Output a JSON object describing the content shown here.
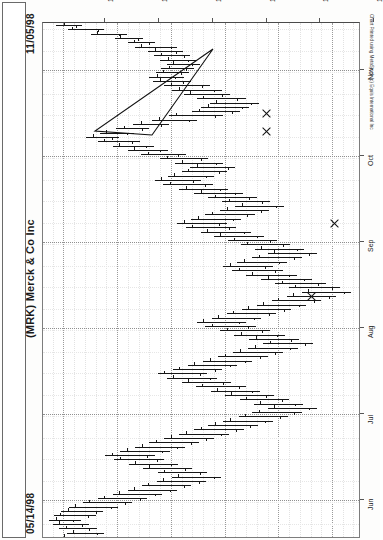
{
  "header": {
    "date_end": "11/05/98",
    "date_start": "05/14/98",
    "title": "(MRK) Merck & Co Inc",
    "detail": "Merck & Co Inc-Daily  12/15/98  C=145.875 +.312  O=145.500  H=146.000  L=141.500  V=3724300"
  },
  "credit": "Chart Printed using MetaStock (c) Equis International Inc",
  "chart_data": {
    "type": "ohlc-bar",
    "title": "(MRK) Merck & Co Inc",
    "orientation": "rotated-90",
    "xlabel": "Date",
    "ylabel": "Price",
    "grid": true,
    "legend": "none",
    "price_axis": {
      "ticks": [
        140,
        135,
        130,
        125,
        120,
        115
      ],
      "labels": [
        "140",
        "135",
        "130",
        "125",
        "120",
        "115"
      ],
      "min": 112.0,
      "max": 141.5
    },
    "date_axis": {
      "ticks": [
        "Nov",
        "Oct",
        "Sep",
        "Aug",
        "Jul",
        "Jun"
      ],
      "range": [
        "05/14/98",
        "11/05/98"
      ]
    },
    "quote": {
      "symbol": "MRK",
      "name": "Merck & Co Inc",
      "period": "Daily",
      "date": "12/15/98",
      "close": 145.875,
      "change": 0.312,
      "open": 145.5,
      "high": 146.0,
      "low": 141.5,
      "volume": 3724300
    },
    "annotations": [
      {
        "type": "triangle",
        "label": "symmetrical-triangle-pattern"
      },
      {
        "type": "x-mark",
        "label": "signal-1"
      },
      {
        "type": "x-mark",
        "label": "signal-2"
      },
      {
        "type": "x-mark",
        "label": "signal-3"
      },
      {
        "type": "x-mark",
        "label": "signal-4"
      }
    ],
    "bars": [
      {
        "d": 0,
        "h": 140.7,
        "l": 138.3,
        "o": 139.9,
        "c": 138.8
      },
      {
        "d": 1,
        "h": 139.6,
        "l": 136.2,
        "o": 139.2,
        "c": 136.8
      },
      {
        "d": 2,
        "h": 137.4,
        "l": 134.1,
        "o": 136.9,
        "c": 134.8
      },
      {
        "d": 3,
        "h": 135.2,
        "l": 132.6,
        "o": 134.7,
        "c": 133.1
      },
      {
        "d": 4,
        "h": 134.0,
        "l": 131.5,
        "o": 133.4,
        "c": 132.0
      },
      {
        "d": 5,
        "h": 133.3,
        "l": 129.4,
        "o": 132.8,
        "c": 130.0
      },
      {
        "d": 6,
        "h": 132.1,
        "l": 128.9,
        "o": 131.5,
        "c": 129.5
      },
      {
        "d": 7,
        "h": 131.6,
        "l": 128.2,
        "o": 130.9,
        "c": 128.8
      },
      {
        "d": 8,
        "h": 131.0,
        "l": 127.7,
        "o": 130.3,
        "c": 128.4
      },
      {
        "d": 9,
        "h": 130.4,
        "l": 127.3,
        "o": 129.8,
        "c": 128.0
      },
      {
        "d": 10,
        "h": 130.9,
        "l": 127.8,
        "o": 130.2,
        "c": 128.6
      },
      {
        "d": 11,
        "h": 131.4,
        "l": 128.3,
        "o": 130.7,
        "c": 129.1
      },
      {
        "d": 12,
        "h": 132.0,
        "l": 128.8,
        "o": 131.3,
        "c": 129.6
      },
      {
        "d": 13,
        "h": 131.7,
        "l": 128.1,
        "o": 131.0,
        "c": 128.9
      },
      {
        "d": 14,
        "h": 130.6,
        "l": 126.4,
        "o": 130.0,
        "c": 127.1
      },
      {
        "d": 15,
        "h": 129.9,
        "l": 125.2,
        "o": 129.2,
        "c": 126.0
      },
      {
        "d": 16,
        "h": 128.8,
        "l": 124.5,
        "o": 128.2,
        "c": 125.2
      },
      {
        "d": 17,
        "h": 127.6,
        "l": 123.0,
        "o": 127.0,
        "c": 123.8
      },
      {
        "d": 18,
        "h": 126.4,
        "l": 121.8,
        "o": 125.8,
        "c": 122.5
      },
      {
        "d": 19,
        "h": 127.2,
        "l": 122.7,
        "o": 126.5,
        "c": 123.4
      },
      {
        "d": 20,
        "h": 128.0,
        "l": 123.6,
        "o": 127.4,
        "c": 124.3
      },
      {
        "d": 21,
        "h": 130.2,
        "l": 125.1,
        "o": 129.5,
        "c": 125.9
      },
      {
        "d": 22,
        "h": 131.8,
        "l": 127.6,
        "o": 131.1,
        "c": 128.3
      },
      {
        "d": 23,
        "h": 133.5,
        "l": 130.2,
        "o": 132.8,
        "c": 130.9
      },
      {
        "d": 24,
        "h": 135.1,
        "l": 132.0,
        "o": 134.4,
        "c": 132.7
      },
      {
        "d": 25,
        "h": 136.6,
        "l": 133.4,
        "o": 136.0,
        "c": 134.1
      },
      {
        "d": 26,
        "h": 137.9,
        "l": 134.8,
        "o": 137.2,
        "c": 135.5
      },
      {
        "d": 27,
        "h": 136.8,
        "l": 132.9,
        "o": 136.2,
        "c": 133.6
      },
      {
        "d": 28,
        "h": 135.4,
        "l": 131.6,
        "o": 134.8,
        "c": 132.3
      },
      {
        "d": 29,
        "h": 134.0,
        "l": 130.3,
        "o": 133.4,
        "c": 131.0
      },
      {
        "d": 30,
        "h": 132.8,
        "l": 128.6,
        "o": 132.1,
        "c": 129.3
      },
      {
        "d": 31,
        "h": 131.0,
        "l": 126.5,
        "o": 130.4,
        "c": 127.2
      },
      {
        "d": 32,
        "h": 129.6,
        "l": 125.1,
        "o": 129.0,
        "c": 125.8
      },
      {
        "d": 33,
        "h": 128.2,
        "l": 124.0,
        "o": 127.6,
        "c": 124.7
      },
      {
        "d": 34,
        "h": 129.0,
        "l": 124.8,
        "o": 128.4,
        "c": 125.5
      },
      {
        "d": 35,
        "h": 130.3,
        "l": 126.0,
        "o": 129.7,
        "c": 126.7
      },
      {
        "d": 36,
        "h": 131.5,
        "l": 127.2,
        "o": 130.9,
        "c": 127.9
      },
      {
        "d": 37,
        "h": 130.7,
        "l": 126.1,
        "o": 130.1,
        "c": 126.8
      },
      {
        "d": 38,
        "h": 129.2,
        "l": 124.7,
        "o": 128.6,
        "c": 125.4
      },
      {
        "d": 39,
        "h": 127.8,
        "l": 123.3,
        "o": 127.2,
        "c": 124.0
      },
      {
        "d": 40,
        "h": 126.5,
        "l": 122.0,
        "o": 125.9,
        "c": 122.7
      },
      {
        "d": 41,
        "h": 125.2,
        "l": 120.8,
        "o": 124.6,
        "c": 121.5
      },
      {
        "d": 42,
        "h": 124.0,
        "l": 119.5,
        "o": 123.4,
        "c": 120.2
      },
      {
        "d": 43,
        "h": 125.4,
        "l": 120.9,
        "o": 124.8,
        "c": 121.6
      },
      {
        "d": 44,
        "h": 126.8,
        "l": 122.2,
        "o": 126.2,
        "c": 122.9
      },
      {
        "d": 45,
        "h": 128.1,
        "l": 123.5,
        "o": 127.5,
        "c": 124.2
      },
      {
        "d": 46,
        "h": 129.4,
        "l": 124.8,
        "o": 128.8,
        "c": 125.5
      },
      {
        "d": 47,
        "h": 128.6,
        "l": 123.9,
        "o": 128.0,
        "c": 124.6
      },
      {
        "d": 48,
        "h": 127.2,
        "l": 122.5,
        "o": 126.6,
        "c": 123.2
      },
      {
        "d": 49,
        "h": 126.0,
        "l": 121.3,
        "o": 125.4,
        "c": 122.0
      },
      {
        "d": 50,
        "h": 124.7,
        "l": 120.1,
        "o": 124.1,
        "c": 120.8
      },
      {
        "d": 51,
        "h": 123.5,
        "l": 118.9,
        "o": 122.9,
        "c": 119.6
      },
      {
        "d": 52,
        "h": 122.2,
        "l": 117.6,
        "o": 121.6,
        "c": 118.3
      },
      {
        "d": 53,
        "h": 121.0,
        "l": 116.4,
        "o": 120.4,
        "c": 117.1
      },
      {
        "d": 54,
        "h": 122.4,
        "l": 117.8,
        "o": 121.8,
        "c": 118.5
      },
      {
        "d": 55,
        "h": 123.8,
        "l": 119.2,
        "o": 123.2,
        "c": 119.9
      },
      {
        "d": 56,
        "h": 125.1,
        "l": 120.5,
        "o": 124.5,
        "c": 121.2
      },
      {
        "d": 57,
        "h": 124.3,
        "l": 119.6,
        "o": 123.7,
        "c": 120.3
      },
      {
        "d": 58,
        "h": 123.0,
        "l": 118.3,
        "o": 122.4,
        "c": 119.0
      },
      {
        "d": 59,
        "h": 121.6,
        "l": 116.9,
        "o": 121.0,
        "c": 117.6
      },
      {
        "d": 60,
        "h": 120.3,
        "l": 115.6,
        "o": 119.7,
        "c": 116.3
      },
      {
        "d": 61,
        "h": 119.0,
        "l": 114.3,
        "o": 118.4,
        "c": 115.0
      },
      {
        "d": 62,
        "h": 117.8,
        "l": 113.2,
        "o": 117.2,
        "c": 113.9
      },
      {
        "d": 63,
        "h": 119.2,
        "l": 114.6,
        "o": 118.6,
        "c": 115.3
      },
      {
        "d": 64,
        "h": 120.6,
        "l": 116.0,
        "o": 120.0,
        "c": 116.7
      },
      {
        "d": 65,
        "h": 122.0,
        "l": 117.4,
        "o": 121.4,
        "c": 118.1
      },
      {
        "d": 66,
        "h": 123.4,
        "l": 118.8,
        "o": 122.8,
        "c": 119.5
      },
      {
        "d": 67,
        "h": 124.8,
        "l": 120.2,
        "o": 124.2,
        "c": 120.9
      },
      {
        "d": 68,
        "h": 126.2,
        "l": 121.6,
        "o": 125.6,
        "c": 122.3
      },
      {
        "d": 69,
        "h": 127.6,
        "l": 123.0,
        "o": 127.0,
        "c": 123.7
      },
      {
        "d": 70,
        "h": 126.8,
        "l": 122.1,
        "o": 126.2,
        "c": 122.8
      },
      {
        "d": 71,
        "h": 125.4,
        "l": 120.8,
        "o": 124.8,
        "c": 121.5
      },
      {
        "d": 72,
        "h": 124.1,
        "l": 119.4,
        "o": 123.5,
        "c": 120.1
      },
      {
        "d": 73,
        "h": 122.7,
        "l": 118.1,
        "o": 122.1,
        "c": 118.8
      },
      {
        "d": 74,
        "h": 121.4,
        "l": 116.8,
        "o": 120.8,
        "c": 117.5
      },
      {
        "d": 75,
        "h": 122.8,
        "l": 118.2,
        "o": 122.2,
        "c": 118.9
      },
      {
        "d": 76,
        "h": 124.2,
        "l": 119.6,
        "o": 123.6,
        "c": 120.3
      },
      {
        "d": 77,
        "h": 125.6,
        "l": 121.0,
        "o": 125.0,
        "c": 121.7
      },
      {
        "d": 78,
        "h": 127.0,
        "l": 122.4,
        "o": 126.4,
        "c": 123.1
      },
      {
        "d": 79,
        "h": 128.4,
        "l": 123.8,
        "o": 127.8,
        "c": 124.5
      },
      {
        "d": 80,
        "h": 129.8,
        "l": 125.2,
        "o": 129.2,
        "c": 125.9
      },
      {
        "d": 81,
        "h": 131.2,
        "l": 126.6,
        "o": 130.6,
        "c": 127.3
      },
      {
        "d": 82,
        "h": 130.4,
        "l": 125.7,
        "o": 129.8,
        "c": 126.4
      },
      {
        "d": 83,
        "h": 129.0,
        "l": 124.4,
        "o": 128.4,
        "c": 125.1
      },
      {
        "d": 84,
        "h": 127.7,
        "l": 123.0,
        "o": 127.1,
        "c": 123.7
      },
      {
        "d": 85,
        "h": 126.3,
        "l": 121.7,
        "o": 125.7,
        "c": 122.4
      },
      {
        "d": 86,
        "h": 125.0,
        "l": 120.4,
        "o": 124.4,
        "c": 121.1
      },
      {
        "d": 87,
        "h": 123.6,
        "l": 119.0,
        "o": 123.0,
        "c": 119.7
      },
      {
        "d": 88,
        "h": 122.3,
        "l": 117.7,
        "o": 121.7,
        "c": 118.4
      },
      {
        "d": 89,
        "h": 121.0,
        "l": 116.4,
        "o": 120.4,
        "c": 117.1
      },
      {
        "d": 90,
        "h": 122.4,
        "l": 117.8,
        "o": 121.8,
        "c": 118.5
      },
      {
        "d": 91,
        "h": 123.7,
        "l": 119.1,
        "o": 123.1,
        "c": 119.8
      },
      {
        "d": 92,
        "h": 125.1,
        "l": 120.5,
        "o": 124.5,
        "c": 121.2
      },
      {
        "d": 93,
        "h": 126.5,
        "l": 121.9,
        "o": 125.9,
        "c": 122.6
      },
      {
        "d": 94,
        "h": 127.8,
        "l": 123.2,
        "o": 127.2,
        "c": 123.9
      },
      {
        "d": 95,
        "h": 129.2,
        "l": 124.6,
        "o": 128.6,
        "c": 125.3
      },
      {
        "d": 96,
        "h": 130.6,
        "l": 126.0,
        "o": 130.0,
        "c": 126.7
      },
      {
        "d": 97,
        "h": 132.0,
        "l": 127.4,
        "o": 131.4,
        "c": 128.1
      },
      {
        "d": 98,
        "h": 133.3,
        "l": 128.7,
        "o": 132.7,
        "c": 129.4
      },
      {
        "d": 99,
        "h": 134.7,
        "l": 130.1,
        "o": 134.1,
        "c": 130.8
      },
      {
        "d": 100,
        "h": 136.1,
        "l": 131.5,
        "o": 135.5,
        "c": 132.2
      },
      {
        "d": 101,
        "h": 135.3,
        "l": 130.6,
        "o": 134.7,
        "c": 131.3
      },
      {
        "d": 102,
        "h": 133.9,
        "l": 129.3,
        "o": 133.3,
        "c": 130.0
      },
      {
        "d": 103,
        "h": 132.6,
        "l": 128.0,
        "o": 132.0,
        "c": 128.7
      },
      {
        "d": 104,
        "h": 131.2,
        "l": 126.6,
        "o": 130.6,
        "c": 127.3
      },
      {
        "d": 105,
        "h": 129.9,
        "l": 125.3,
        "o": 129.3,
        "c": 126.0
      },
      {
        "d": 106,
        "h": 131.3,
        "l": 126.7,
        "o": 130.7,
        "c": 127.4
      },
      {
        "d": 107,
        "h": 132.7,
        "l": 128.1,
        "o": 132.1,
        "c": 128.8
      },
      {
        "d": 108,
        "h": 134.0,
        "l": 129.4,
        "o": 133.4,
        "c": 130.1
      },
      {
        "d": 109,
        "h": 135.4,
        "l": 130.8,
        "o": 134.8,
        "c": 131.5
      },
      {
        "d": 110,
        "h": 136.8,
        "l": 132.2,
        "o": 136.2,
        "c": 132.9
      },
      {
        "d": 111,
        "h": 138.2,
        "l": 133.6,
        "o": 137.6,
        "c": 134.3
      },
      {
        "d": 112,
        "h": 139.5,
        "l": 134.9,
        "o": 138.9,
        "c": 135.6
      },
      {
        "d": 113,
        "h": 140.2,
        "l": 136.3,
        "o": 139.6,
        "c": 137.0
      },
      {
        "d": 114,
        "h": 140.9,
        "l": 137.0,
        "o": 140.3,
        "c": 137.7
      },
      {
        "d": 115,
        "h": 141.3,
        "l": 138.4,
        "o": 140.7,
        "c": 139.1
      },
      {
        "d": 116,
        "h": 141.0,
        "l": 137.6,
        "o": 140.4,
        "c": 138.3
      },
      {
        "d": 117,
        "h": 140.4,
        "l": 136.9,
        "o": 139.8,
        "c": 137.6
      },
      {
        "d": 118,
        "h": 139.7,
        "l": 136.2,
        "o": 139.1,
        "c": 136.9
      },
      {
        "d": 119,
        "h": 140.5,
        "l": 137.0,
        "o": 139.9,
        "c": 137.7
      }
    ]
  }
}
